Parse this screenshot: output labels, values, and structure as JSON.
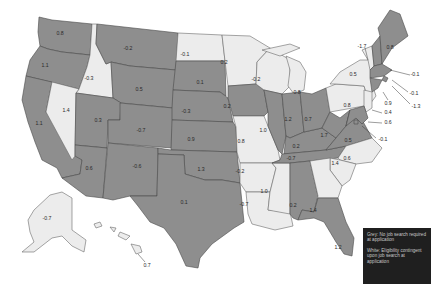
{
  "map": {
    "type": "choropleth",
    "region": "United States",
    "colors": {
      "grey": "#8e8e8e",
      "white": "#ececec",
      "legend_bg": "#1f1f1f",
      "legend_text": "#c8c8c8"
    },
    "legend": {
      "grey": "Grey: No job search required at application",
      "white": "White: Eligibility contingent upon job search at application"
    },
    "states": [
      {
        "code": "WA",
        "value": "0.8",
        "category": "grey"
      },
      {
        "code": "OR",
        "value": "1.1",
        "category": "grey"
      },
      {
        "code": "CA",
        "value": "1.1",
        "category": "grey"
      },
      {
        "code": "ID",
        "value": "-0.3",
        "category": "white"
      },
      {
        "code": "NV",
        "value": "1.4",
        "category": "white"
      },
      {
        "code": "MT",
        "value": "-0.2",
        "category": "grey"
      },
      {
        "code": "WY",
        "value": "0.5",
        "category": "grey"
      },
      {
        "code": "UT",
        "value": "0.3",
        "category": "grey"
      },
      {
        "code": "AZ",
        "value": "0.6",
        "category": "grey"
      },
      {
        "code": "CO",
        "value": "-0.7",
        "category": "grey"
      },
      {
        "code": "NM",
        "value": "-0.6",
        "category": "grey"
      },
      {
        "code": "ND",
        "value": "-0.1",
        "category": "white"
      },
      {
        "code": "SD",
        "value": "0.1",
        "category": "grey"
      },
      {
        "code": "NE",
        "value": "-0.3",
        "category": "grey"
      },
      {
        "code": "KS",
        "value": "0.9",
        "category": "grey"
      },
      {
        "code": "OK",
        "value": "1.3",
        "category": "grey"
      },
      {
        "code": "TX",
        "value": "0.1",
        "category": "grey"
      },
      {
        "code": "MN",
        "value": "0.2",
        "category": "white"
      },
      {
        "code": "IA",
        "value": "0.2",
        "category": "grey"
      },
      {
        "code": "MO",
        "value": "0.8",
        "category": "white"
      },
      {
        "code": "AR",
        "value": "-0.2",
        "category": "white"
      },
      {
        "code": "LA",
        "value": "-0.7",
        "category": "white"
      },
      {
        "code": "WI",
        "value": "-0.2",
        "category": "white"
      },
      {
        "code": "IL",
        "value": "1.0",
        "category": "grey"
      },
      {
        "code": "MS",
        "value": "1.0",
        "category": "white"
      },
      {
        "code": "MI",
        "value": "0.8",
        "category": "white"
      },
      {
        "code": "IN",
        "value": "1.2",
        "category": "grey"
      },
      {
        "code": "KY",
        "value": "0.2",
        "category": "grey"
      },
      {
        "code": "TN",
        "value": "-0.7",
        "category": "grey"
      },
      {
        "code": "AL",
        "value": "0.2",
        "category": "grey"
      },
      {
        "code": "OH",
        "value": "0.7",
        "category": "grey"
      },
      {
        "code": "WV",
        "value": "1.7",
        "category": "grey"
      },
      {
        "code": "VA",
        "value": "0.5",
        "category": "grey"
      },
      {
        "code": "NC",
        "value": "0.6",
        "category": "white"
      },
      {
        "code": "SC",
        "value": "1.4",
        "category": "white"
      },
      {
        "code": "GA",
        "value": "1.4",
        "category": "white"
      },
      {
        "code": "FL",
        "value": "1.2",
        "category": "grey"
      },
      {
        "code": "PA",
        "value": "0.8",
        "category": "white"
      },
      {
        "code": "NY",
        "value": "0.5",
        "category": "white"
      },
      {
        "code": "VT",
        "value": "-1.7",
        "category": "white"
      },
      {
        "code": "NH",
        "value": "-0.1",
        "category": "grey"
      },
      {
        "code": "ME",
        "value": "0.8",
        "category": "grey"
      },
      {
        "code": "MA",
        "value": "-0.1",
        "category": "grey"
      },
      {
        "code": "RI",
        "value": "-1.3",
        "category": "grey"
      },
      {
        "code": "CT",
        "value": "0.9",
        "category": "grey"
      },
      {
        "code": "NJ",
        "value": "0.4",
        "category": "white"
      },
      {
        "code": "MD",
        "value": "0.6",
        "category": "grey"
      },
      {
        "code": "DC",
        "value": "-0.1",
        "category": "grey"
      },
      {
        "code": "AK",
        "value": "-0.7",
        "category": "white"
      },
      {
        "code": "HI",
        "value": "0.7",
        "category": "white"
      }
    ]
  }
}
